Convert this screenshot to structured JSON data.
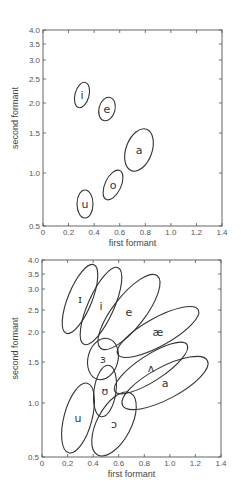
{
  "chart_data": [
    {
      "type": "scatter",
      "title": "",
      "xlabel": "first formant",
      "ylabel": "second formant",
      "xlim": [
        0,
        1.4
      ],
      "ylim": [
        0.5,
        4.0
      ],
      "y_scale": "nonlinear (perceptual)",
      "grid": false,
      "legend": "none",
      "x_ticks": [
        "0",
        "0.2",
        "0.4",
        "0.6",
        "0.8",
        "1.0",
        "1.2",
        "1.4"
      ],
      "y_ticks": [
        "0.5",
        "1.0",
        "1.5",
        "2.0",
        "2.5",
        "3.0",
        "3.5",
        "4.0"
      ],
      "frame": {
        "x0": 43,
        "x1": 222,
        "y_top": 30,
        "y_bottom": 226
      },
      "y_tick_px": {
        "4.0": 30,
        "3.5": 44,
        "3.0": 60,
        "2.5": 79,
        "2.0": 103,
        "1.5": 133,
        "1.0": 173,
        "0.5": 226
      },
      "vowels": [
        {
          "label": "i",
          "f1": 0.3,
          "f2": 2.15,
          "cx": 82,
          "cy": 95,
          "rx": 7,
          "ry": 13,
          "angle": 15
        },
        {
          "label": "e",
          "f1": 0.5,
          "f2": 1.9,
          "cx": 107,
          "cy": 109,
          "rx": 8,
          "ry": 12,
          "angle": 15
        },
        {
          "label": "a",
          "f1": 0.75,
          "f2": 1.3,
          "cx": 139,
          "cy": 150,
          "rx": 13,
          "ry": 22,
          "angle": 20
        },
        {
          "label": "o",
          "f1": 0.55,
          "f2": 0.87,
          "cx": 113,
          "cy": 185,
          "rx": 8,
          "ry": 16,
          "angle": 25
        },
        {
          "label": "u",
          "f1": 0.33,
          "f2": 0.7,
          "cx": 85,
          "cy": 204,
          "rx": 8,
          "ry": 14,
          "angle": 0
        }
      ]
    },
    {
      "type": "scatter",
      "title": "",
      "xlabel": "first formant",
      "ylabel": "second formant",
      "xlim": [
        0,
        1.4
      ],
      "ylim": [
        0.5,
        4.0
      ],
      "y_scale": "nonlinear (perceptual)",
      "grid": false,
      "legend": "none",
      "x_ticks": [
        "0",
        "0.2",
        "0.4",
        "0.6",
        "0.8",
        "1.0",
        "1.2",
        "1.4"
      ],
      "y_ticks": [
        "0.5",
        "1.0",
        "1.5",
        "2.0",
        "2.5",
        "3.0",
        "3.5",
        "4.0"
      ],
      "frame": {
        "x0": 42,
        "x1": 221,
        "y_top": 260,
        "y_bottom": 457
      },
      "y_tick_px": {
        "4.0": 260,
        "3.5": 274,
        "3.0": 289,
        "2.5": 310,
        "2.0": 332,
        "1.5": 362,
        "1.0": 403,
        "0.5": 457
      },
      "vowels": [
        {
          "label": "ɪ",
          "f1": 0.3,
          "f2": 2.6,
          "cx": 80,
          "cy": 299,
          "rx": 12,
          "ry": 37,
          "angle": 22
        },
        {
          "label": "i",
          "f1": 0.46,
          "f2": 2.4,
          "cx": 101,
          "cy": 306,
          "rx": 13,
          "ry": 42,
          "angle": 24
        },
        {
          "label": "e",
          "f1": 0.68,
          "f2": 2.3,
          "cx": 129,
          "cy": 312,
          "rx": 16,
          "ry": 46,
          "angle": 38
        },
        {
          "label": "æ",
          "f1": 0.91,
          "f2": 2.0,
          "cx": 158,
          "cy": 332,
          "rx": 46,
          "ry": 14,
          "angle": -29
        },
        {
          "label": "ɜ",
          "f1": 0.48,
          "f2": 1.55,
          "cx": 103,
          "cy": 359,
          "rx": 15,
          "ry": 21,
          "angle": 15
        },
        {
          "label": "ʌ",
          "f1": 0.85,
          "f2": 1.45,
          "cx": 151,
          "cy": 368,
          "rx": 43,
          "ry": 13,
          "angle": -33
        },
        {
          "label": "a",
          "f1": 0.96,
          "f2": 1.3,
          "cx": 165,
          "cy": 383,
          "rx": 48,
          "ry": 16,
          "angle": -28
        },
        {
          "label": "ʊ",
          "f1": 0.49,
          "f2": 1.15,
          "cx": 105,
          "cy": 391,
          "rx": 11,
          "ry": 26,
          "angle": 8
        },
        {
          "label": "u",
          "f1": 0.28,
          "f2": 0.8,
          "cx": 78,
          "cy": 418,
          "rx": 14,
          "ry": 36,
          "angle": 15
        },
        {
          "label": "ɔ",
          "f1": 0.57,
          "f2": 0.75,
          "cx": 114,
          "cy": 424,
          "rx": 17,
          "ry": 35,
          "angle": 28
        }
      ]
    }
  ],
  "charts": [
    {
      "xlabel": "first formant",
      "ylabel": "second formant"
    },
    {
      "xlabel": "first formant",
      "ylabel": "second formant"
    }
  ]
}
